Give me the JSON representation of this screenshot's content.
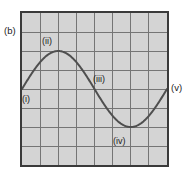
{
  "figure": {
    "panel_label": "(b)",
    "width": 190,
    "height": 180,
    "background_color": "#ffffff",
    "plot_fill_color": "#d4d4d4",
    "frame_color": "#3a3a3a",
    "grid_color": "#757575",
    "curve_color": "#4f4f4f"
  },
  "annotations": {
    "i": "(i)",
    "ii": "(ii)",
    "iii": "(iii)",
    "iv": "(iv)",
    "v": "(v)"
  },
  "chart_data": {
    "type": "line",
    "title": "(b)",
    "xlabel": "",
    "ylabel": "",
    "grid": true,
    "legend": "none",
    "xlim": [
      0,
      8
    ],
    "ylim": [
      0,
      8
    ],
    "x_gridlines": [
      1,
      2,
      3,
      4,
      5,
      6,
      7
    ],
    "y_gridlines": [
      1,
      2,
      3,
      4,
      5,
      6,
      7
    ],
    "x_tick_labels": [],
    "y_tick_labels": [],
    "series": [
      {
        "name": "wave",
        "description": "single full-period sinusoid, amplitude 2 about midline y=4",
        "x": [
          0,
          0.5,
          1,
          1.5,
          2,
          2.5,
          3,
          3.5,
          4,
          4.5,
          5,
          5.5,
          6,
          6.5,
          7,
          7.5,
          8
        ],
        "y": [
          4.0,
          4.77,
          5.41,
          5.85,
          6.0,
          5.85,
          5.41,
          4.77,
          4.0,
          3.23,
          2.59,
          2.15,
          2.0,
          2.15,
          2.59,
          3.23,
          4.0
        ]
      }
    ],
    "annotated_points": [
      {
        "label": "(i)",
        "x": 0,
        "y": 4,
        "note": "curve start at left edge, midline"
      },
      {
        "label": "(ii)",
        "x": 2,
        "y": 6,
        "note": "crest / maximum"
      },
      {
        "label": "(iii)",
        "x": 4,
        "y": 4,
        "note": "descending zero crossing / midline"
      },
      {
        "label": "(iv)",
        "x": 6,
        "y": 2,
        "note": "trough / minimum"
      },
      {
        "label": "(v)",
        "x": 8,
        "y": 4,
        "note": "curve end at right edge, midline"
      }
    ]
  }
}
